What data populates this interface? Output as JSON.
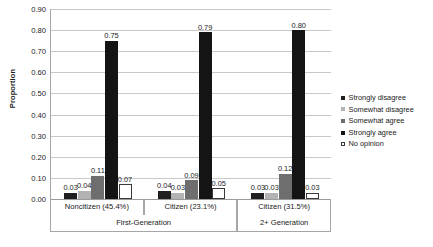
{
  "chart_data": {
    "type": "bar",
    "title": "",
    "xlabel": "",
    "ylabel": "Proportion",
    "ylim": [
      0.0,
      0.9
    ],
    "ytick_labels": [
      "0.00",
      "0.10",
      "0.20",
      "0.30",
      "0.40",
      "0.50",
      "0.60",
      "0.70",
      "0.80",
      "0.90"
    ],
    "ytick_values": [
      0.0,
      0.1,
      0.2,
      0.3,
      0.4,
      0.5,
      0.6,
      0.7,
      0.8,
      0.9
    ],
    "grid": true,
    "legend_position": "right",
    "categories": [
      "Noncitizen (45.4%)",
      "Citizen (23.1%)",
      "Citizen (31.5%)"
    ],
    "group_labels": [
      "First-Generation",
      "2+ Generation"
    ],
    "group_spans": [
      2,
      1
    ],
    "series": [
      {
        "name": "Strongly disagree",
        "color": "#1f1f1f",
        "values": [
          0.03,
          0.04,
          0.03
        ]
      },
      {
        "name": "Somewhat disagree",
        "color": "#b3b3b3",
        "values": [
          0.04,
          0.03,
          0.03
        ]
      },
      {
        "name": "Somewhat agree",
        "color": "#6e6e6e",
        "values": [
          0.11,
          0.09,
          0.12
        ]
      },
      {
        "name": "Strongly agree",
        "color": "#141414",
        "values": [
          0.75,
          0.79,
          0.8
        ]
      },
      {
        "name": "No opinion",
        "color": "#ffffff",
        "values": [
          0.07,
          0.05,
          0.03
        ]
      }
    ],
    "data_labels": [
      [
        "0.03",
        "0.04",
        "0.11",
        "0.75",
        "0.07"
      ],
      [
        "0.04",
        "0.03",
        "0.09",
        "0.79",
        "0.05"
      ],
      [
        "0.03",
        "0.03",
        "0.12",
        "0.80",
        "0.03"
      ]
    ]
  },
  "legend": {
    "items": [
      {
        "label": "Strongly disagree"
      },
      {
        "label": "Somewhat disagree"
      },
      {
        "label": "Somewhat agree"
      },
      {
        "label": "Strongly agree"
      },
      {
        "label": "No opinion"
      }
    ]
  }
}
